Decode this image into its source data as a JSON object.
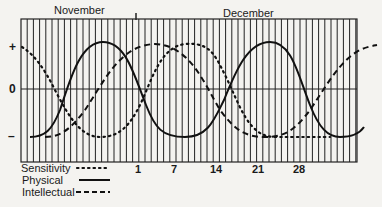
{
  "chart_data": {
    "type": "line",
    "months": [
      "November",
      "December"
    ],
    "y_axis_labels": [
      "+",
      "0",
      "–"
    ],
    "x_tick_labels": [
      "1",
      "7",
      "14",
      "21",
      "28"
    ],
    "ylim": [
      -1,
      1
    ],
    "grid": "vertical lines, one per day",
    "legend_position": "bottom-left",
    "series": [
      {
        "name": "Sensitivity",
        "style": "dotted",
        "period_days": 28,
        "points": [
          [
            -19,
            1
          ],
          [
            -12,
            0
          ],
          [
            -5,
            -1
          ],
          [
            2,
            0
          ],
          [
            9,
            1
          ],
          [
            16,
            0
          ],
          [
            23,
            -1
          ],
          [
            26,
            -1
          ]
        ]
      },
      {
        "name": "Physical",
        "style": "solid",
        "period_days": 23,
        "points": [
          [
            -19,
            -1
          ],
          [
            -13,
            0
          ],
          [
            -7.5,
            1
          ],
          [
            -2,
            0
          ],
          [
            3.5,
            -1
          ],
          [
            9,
            0
          ],
          [
            14.5,
            1
          ],
          [
            20,
            0
          ],
          [
            25.5,
            -1
          ],
          [
            31,
            -0.9
          ]
        ]
      },
      {
        "name": "Intellectual",
        "style": "dashed",
        "period_days": 33,
        "points": [
          [
            -18,
            -1
          ],
          [
            -10,
            0
          ],
          [
            -2,
            1
          ],
          [
            6,
            0
          ],
          [
            14,
            -1
          ],
          [
            22,
            -0.6
          ],
          [
            26,
            0
          ],
          [
            33,
            1
          ]
        ]
      }
    ]
  },
  "labels": {
    "month_1": "November",
    "month_2": "December",
    "plus": "+",
    "zero": "0",
    "minus": "–",
    "day_1": "1",
    "day_7": "7",
    "day_14": "14",
    "day_21": "21",
    "day_28": "28",
    "legend_sensitivity": "Sensitivity",
    "legend_physical": "Physical",
    "legend_intellectual": "Intellectual"
  }
}
